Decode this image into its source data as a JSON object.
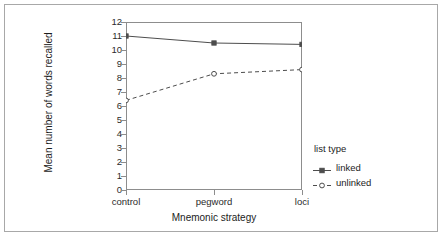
{
  "chart_data": {
    "type": "line",
    "title": "",
    "xlabel": "Mnemonic strategy",
    "ylabel": "Mean number of words recalled",
    "categories": [
      "control",
      "pegword",
      "loci"
    ],
    "ylim": [
      0,
      12
    ],
    "yticks": [
      0,
      1,
      2,
      3,
      4,
      5,
      6,
      7,
      8,
      9,
      10,
      11,
      12
    ],
    "ytick_labels": [
      "0",
      "1",
      "2",
      "3",
      "4",
      "5",
      "6",
      "7",
      "8",
      "9",
      "10",
      "11",
      "12"
    ],
    "grid": false,
    "legend_position": "right",
    "legend_title": "list type",
    "series": [
      {
        "name": "linked",
        "values": [
          11.0,
          10.5,
          10.4
        ],
        "line_style": "solid",
        "marker": "filled-square",
        "color": "#4d4d4d"
      },
      {
        "name": "unlinked",
        "values": [
          6.4,
          8.3,
          8.6
        ],
        "line_style": "dashed",
        "marker": "open-circle",
        "color": "#4d4d4d"
      }
    ]
  },
  "axes": {
    "y_title": "Mean number of words recalled",
    "x_title": "Mnemonic strategy",
    "y_tick_labels": [
      "12",
      "11",
      "10",
      "9",
      "8",
      "7",
      "6",
      "5",
      "4",
      "3",
      "2",
      "1",
      "0"
    ],
    "x_tick_labels": [
      "control",
      "pegword",
      "loci"
    ]
  },
  "legend": {
    "title": "list type",
    "entries": [
      {
        "label": "linked"
      },
      {
        "label": "unlinked"
      }
    ]
  }
}
